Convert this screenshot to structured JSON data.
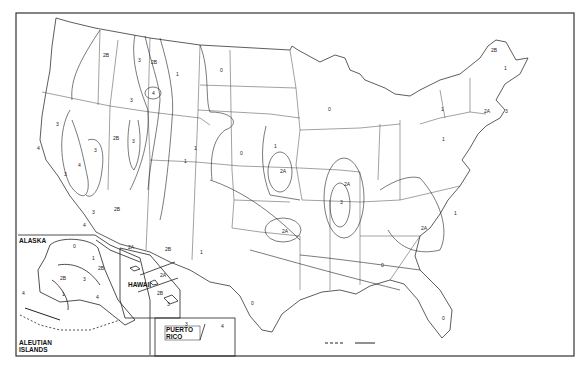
{
  "map": {
    "title": "Seismic Zone Map of the United States",
    "insets": {
      "alaska": "ALASKA",
      "aleutian": "ALEUTIAN ISLANDS",
      "hawaii": "HAWAII",
      "puerto_rico": "PUERTO RICO"
    },
    "zone_labels": [
      {
        "id": "wa-2b",
        "text": "2B",
        "x": 103,
        "y": 53
      },
      {
        "id": "id-3",
        "text": "3",
        "x": 138,
        "y": 58
      },
      {
        "id": "mt-2b",
        "text": "2B",
        "x": 151,
        "y": 60
      },
      {
        "id": "mt-1",
        "text": "1",
        "x": 176,
        "y": 72
      },
      {
        "id": "mt-4",
        "text": "4",
        "x": 152,
        "y": 91
      },
      {
        "id": "id-3b",
        "text": "3",
        "x": 130,
        "y": 98
      },
      {
        "id": "or-3",
        "text": "3",
        "x": 56,
        "y": 122
      },
      {
        "id": "nv-2b",
        "text": "2B",
        "x": 113,
        "y": 136
      },
      {
        "id": "ut-3",
        "text": "3",
        "x": 132,
        "y": 139
      },
      {
        "id": "ca-3a",
        "text": "3",
        "x": 94,
        "y": 148
      },
      {
        "id": "ca-4a",
        "text": "4",
        "x": 37,
        "y": 146
      },
      {
        "id": "ca-4",
        "text": "4",
        "x": 78,
        "y": 163
      },
      {
        "id": "ca-3",
        "text": "3",
        "x": 64,
        "y": 172
      },
      {
        "id": "ca-3c",
        "text": "3",
        "x": 92,
        "y": 210
      },
      {
        "id": "ca-4b",
        "text": "4",
        "x": 83,
        "y": 223
      },
      {
        "id": "az-2b",
        "text": "2B",
        "x": 114,
        "y": 207
      },
      {
        "id": "co-1",
        "text": "1",
        "x": 184,
        "y": 159
      },
      {
        "id": "wy-1",
        "text": "1",
        "x": 194,
        "y": 146
      },
      {
        "id": "az-2a",
        "text": "2A",
        "x": 128,
        "y": 245
      },
      {
        "id": "nm-2b",
        "text": "2B",
        "x": 165,
        "y": 247
      },
      {
        "id": "nm-1",
        "text": "1",
        "x": 200,
        "y": 250
      },
      {
        "id": "nd-0",
        "text": "0",
        "x": 220,
        "y": 68
      },
      {
        "id": "ks-0",
        "text": "0",
        "x": 240,
        "y": 151
      },
      {
        "id": "ne-1",
        "text": "1",
        "x": 274,
        "y": 144
      },
      {
        "id": "ks-2a",
        "text": "2A",
        "x": 280,
        "y": 169
      },
      {
        "id": "ok-2a",
        "text": "2A",
        "x": 282,
        "y": 229
      },
      {
        "id": "tx-0",
        "text": "0",
        "x": 251,
        "y": 301
      },
      {
        "id": "wi-0",
        "text": "0",
        "x": 328,
        "y": 107
      },
      {
        "id": "il-2a",
        "text": "2A",
        "x": 344,
        "y": 182
      },
      {
        "id": "nm-3",
        "text": "3",
        "x": 340,
        "y": 200
      },
      {
        "id": "oh-1",
        "text": "1",
        "x": 442,
        "y": 137
      },
      {
        "id": "ny-1",
        "text": "1",
        "x": 441,
        "y": 107
      },
      {
        "id": "sc-2a",
        "text": "2A",
        "x": 421,
        "y": 226
      },
      {
        "id": "nc-1",
        "text": "1",
        "x": 454,
        "y": 211
      },
      {
        "id": "ga-0",
        "text": "0",
        "x": 381,
        "y": 263
      },
      {
        "id": "fl-0",
        "text": "0",
        "x": 442,
        "y": 316
      },
      {
        "id": "me-2b",
        "text": "2B",
        "x": 491,
        "y": 48
      },
      {
        "id": "me-1",
        "text": "1",
        "x": 504,
        "y": 66
      },
      {
        "id": "ma-2a",
        "text": "2A",
        "x": 484,
        "y": 109
      },
      {
        "id": "ma-3",
        "text": "3",
        "x": 505,
        "y": 109
      },
      {
        "id": "ak-0",
        "text": "0",
        "x": 73,
        "y": 244
      },
      {
        "id": "ak-1",
        "text": "1",
        "x": 92,
        "y": 256
      },
      {
        "id": "ak-2b",
        "text": "2B",
        "x": 98,
        "y": 266
      },
      {
        "id": "ak-2b2",
        "text": "2B",
        "x": 60,
        "y": 276
      },
      {
        "id": "ak-3",
        "text": "3",
        "x": 83,
        "y": 277
      },
      {
        "id": "ak-1b",
        "text": "1",
        "x": 62,
        "y": 292
      },
      {
        "id": "ak-4",
        "text": "4",
        "x": 96,
        "y": 295
      },
      {
        "id": "ak-4b",
        "text": "4",
        "x": 22,
        "y": 291
      },
      {
        "id": "hi-2a",
        "text": "2A",
        "x": 160,
        "y": 273
      },
      {
        "id": "hi-2b",
        "text": "2B",
        "x": 157,
        "y": 291
      },
      {
        "id": "hi-3",
        "text": "3",
        "x": 167,
        "y": 302
      },
      {
        "id": "pr-3",
        "text": "3",
        "x": 185,
        "y": 322
      },
      {
        "id": "pr-4",
        "text": "4",
        "x": 221,
        "y": 324
      }
    ],
    "colors": {
      "line": "#333333",
      "border": "#222222",
      "background": "#ffffff"
    }
  }
}
